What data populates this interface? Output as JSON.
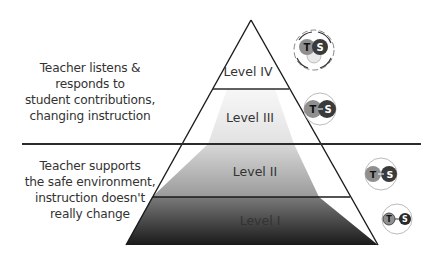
{
  "diagram": {
    "levels": [
      {
        "id": "level-4",
        "label": "Level IV",
        "icon": "teacher-student-cycle-icon"
      },
      {
        "id": "level-3",
        "label": "Level III",
        "icon": "teacher-student-overlap-icon"
      },
      {
        "id": "level-2",
        "label": "Level II",
        "icon": "teacher-student-partial-icon"
      },
      {
        "id": "level-1",
        "label": "Level I",
        "icon": "teacher-to-student-icon"
      }
    ],
    "descriptions": {
      "upper": [
        "Teacher listens &",
        "responds to",
        "student contributions,",
        "changing instruction"
      ],
      "lower": [
        "Teacher supports",
        "the safe environment,",
        "instruction doesn't",
        "really change"
      ]
    },
    "icon_letters": {
      "teacher": "T",
      "student": "S"
    },
    "colors": {
      "outline": "#1a1a1a",
      "divider": "#2b2b2b",
      "level4_fill": "#ffffff",
      "level3_fill": "#eeeeee",
      "level2_fill": "#b0b0b0",
      "level1_fill": "#2a2a2a",
      "teacher_circle": "#8f8f8f",
      "student_circle": "#3a3a3a"
    }
  }
}
